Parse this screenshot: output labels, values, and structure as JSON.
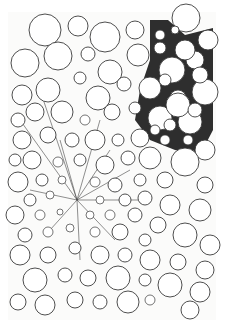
{
  "image": {
    "subject": "pen-and-ink drawing of densely packed circles with a stippled dark region at upper right and radial lines converging near center-left",
    "background": "#ffffff",
    "paper_color": "#fbfbfa",
    "ink_color": "#3a3a3a",
    "stipple_color": "#2e2e2e",
    "drawing_bounds": {
      "x": 10,
      "y": 14,
      "width": 204,
      "height": 304
    },
    "focal_point": {
      "x": 77,
      "y": 200
    },
    "stipple_region": [
      [
        150,
        20
      ],
      [
        168,
        20
      ],
      [
        185,
        35
      ],
      [
        213,
        28
      ],
      [
        213,
        130
      ],
      [
        200,
        155
      ],
      [
        175,
        150
      ],
      [
        150,
        140
      ],
      [
        135,
        120
      ],
      [
        140,
        90
      ],
      [
        150,
        60
      ]
    ],
    "circles": [
      [
        45,
        30,
        16
      ],
      [
        78,
        26,
        10
      ],
      [
        105,
        37,
        15
      ],
      [
        135,
        30,
        9
      ],
      [
        186,
        18,
        14
      ],
      [
        208,
        40,
        10
      ],
      [
        25,
        63,
        14
      ],
      [
        58,
        56,
        14
      ],
      [
        88,
        54,
        7
      ],
      [
        110,
        72,
        12
      ],
      [
        138,
        55,
        11
      ],
      [
        160,
        48,
        6
      ],
      [
        172,
        70,
        13
      ],
      [
        195,
        60,
        9
      ],
      [
        205,
        92,
        13
      ],
      [
        22,
        95,
        10
      ],
      [
        48,
        90,
        12
      ],
      [
        80,
        78,
        6
      ],
      [
        98,
        98,
        12
      ],
      [
        124,
        84,
        7
      ],
      [
        150,
        88,
        11
      ],
      [
        178,
        98,
        8
      ],
      [
        190,
        122,
        12
      ],
      [
        18,
        120,
        7
      ],
      [
        35,
        112,
        9
      ],
      [
        62,
        112,
        11
      ],
      [
        85,
        120,
        5
      ],
      [
        112,
        112,
        8
      ],
      [
        135,
        108,
        6
      ],
      [
        160,
        118,
        12
      ],
      [
        140,
        138,
        9
      ],
      [
        22,
        140,
        9
      ],
      [
        48,
        135,
        8
      ],
      [
        72,
        140,
        7
      ],
      [
        95,
        140,
        10
      ],
      [
        118,
        140,
        6
      ],
      [
        165,
        140,
        5
      ],
      [
        205,
        150,
        10
      ],
      [
        15,
        160,
        6
      ],
      [
        32,
        160,
        9
      ],
      [
        58,
        162,
        5
      ],
      [
        80,
        160,
        6
      ],
      [
        105,
        165,
        9
      ],
      [
        128,
        158,
        7
      ],
      [
        150,
        158,
        11
      ],
      [
        185,
        162,
        14
      ],
      [
        18,
        182,
        10
      ],
      [
        42,
        180,
        6
      ],
      [
        62,
        180,
        4
      ],
      [
        95,
        182,
        5
      ],
      [
        115,
        185,
        7
      ],
      [
        140,
        180,
        6
      ],
      [
        165,
        180,
        8
      ],
      [
        205,
        185,
        8
      ],
      [
        30,
        200,
        6
      ],
      [
        50,
        195,
        4
      ],
      [
        100,
        200,
        4
      ],
      [
        125,
        200,
        6
      ],
      [
        145,
        198,
        7
      ],
      [
        170,
        205,
        10
      ],
      [
        200,
        210,
        11
      ],
      [
        15,
        215,
        9
      ],
      [
        40,
        215,
        5
      ],
      [
        60,
        212,
        3
      ],
      [
        90,
        215,
        4
      ],
      [
        110,
        215,
        5
      ],
      [
        135,
        215,
        7
      ],
      [
        158,
        225,
        8
      ],
      [
        185,
        235,
        12
      ],
      [
        25,
        235,
        7
      ],
      [
        48,
        232,
        5
      ],
      [
        70,
        228,
        4
      ],
      [
        95,
        232,
        5
      ],
      [
        120,
        232,
        8
      ],
      [
        145,
        240,
        6
      ],
      [
        210,
        245,
        10
      ],
      [
        20,
        255,
        10
      ],
      [
        48,
        255,
        8
      ],
      [
        75,
        248,
        6
      ],
      [
        100,
        255,
        9
      ],
      [
        125,
        255,
        7
      ],
      [
        150,
        260,
        10
      ],
      [
        178,
        262,
        8
      ],
      [
        205,
        270,
        9
      ],
      [
        35,
        280,
        12
      ],
      [
        65,
        275,
        7
      ],
      [
        88,
        278,
        8
      ],
      [
        118,
        278,
        12
      ],
      [
        145,
        280,
        6
      ],
      [
        170,
        285,
        12
      ],
      [
        200,
        292,
        10
      ],
      [
        18,
        302,
        8
      ],
      [
        45,
        305,
        10
      ],
      [
        75,
        300,
        8
      ],
      [
        100,
        302,
        7
      ],
      [
        128,
        302,
        11
      ],
      [
        150,
        300,
        5
      ],
      [
        190,
        310,
        9
      ]
    ],
    "stipple_holes": [
      [
        185,
        50,
        10
      ],
      [
        200,
        75,
        8
      ],
      [
        178,
        105,
        12
      ],
      [
        165,
        80,
        6
      ],
      [
        195,
        110,
        7
      ],
      [
        155,
        130,
        5
      ],
      [
        170,
        125,
        6
      ],
      [
        188,
        140,
        5
      ],
      [
        160,
        35,
        5
      ],
      [
        175,
        30,
        4
      ]
    ]
  }
}
